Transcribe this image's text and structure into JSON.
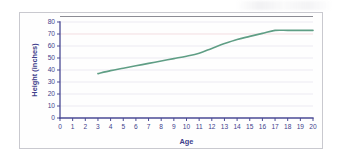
{
  "figure": {
    "card_border_color": "#c9c9cf",
    "background_color": "#ffffff"
  },
  "chart_data": {
    "type": "line",
    "title": "",
    "subtitle": "",
    "xlabel": "Age",
    "ylabel": "Height (inches)",
    "xlim": [
      0,
      20
    ],
    "ylim": [
      0,
      80
    ],
    "xticks": [
      0,
      1,
      2,
      3,
      4,
      5,
      6,
      7,
      8,
      9,
      10,
      11,
      12,
      13,
      14,
      15,
      16,
      17,
      18,
      19,
      20
    ],
    "xtick_labels": [
      "0",
      "1",
      "2",
      "3",
      "4",
      "5",
      "6",
      "7",
      "8",
      "9",
      "10",
      "11",
      "12",
      "13",
      "14",
      "15",
      "16",
      "17",
      "18",
      "19",
      "20"
    ],
    "yticks": [
      0,
      10,
      20,
      30,
      40,
      50,
      60,
      70,
      80
    ],
    "ytick_labels": [
      "0",
      "10",
      "20",
      "30",
      "40",
      "50",
      "60",
      "70",
      "80"
    ],
    "grid": "horizontal",
    "grid_color": "#eceaf2",
    "grid_highlight_value": 70,
    "grid_highlight_color": "#f3dde1",
    "axis_color": "#4a4a94",
    "legend": "none",
    "series": [
      {
        "name": "Height",
        "color": "#5f9e85",
        "line_width": 1.6,
        "x": [
          3,
          4,
          5,
          6,
          7,
          8,
          9,
          10,
          11,
          12,
          13,
          14,
          15,
          16,
          17,
          18,
          19,
          20
        ],
        "values": [
          37,
          39.5,
          41.5,
          43.5,
          45.5,
          47.5,
          49.5,
          51.5,
          54,
          58,
          62,
          65.5,
          68,
          70.5,
          73,
          73,
          73,
          73
        ]
      }
    ]
  },
  "axis_titles": {
    "x": "Age",
    "y": "Height (inches)"
  }
}
